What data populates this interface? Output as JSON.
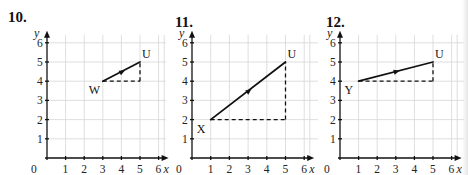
{
  "chart_data": [
    {
      "type": "line",
      "question": "10.",
      "xlabel": "x",
      "ylabel": "y",
      "xlim": [
        0,
        6
      ],
      "ylim": [
        0,
        6
      ],
      "x_ticks": [
        "0",
        "1",
        "2",
        "3",
        "4",
        "5",
        "6"
      ],
      "y_ticks": [
        "1",
        "2",
        "3",
        "4",
        "5",
        "6"
      ],
      "grid": true,
      "vector": {
        "from": {
          "label": "W",
          "x": 3,
          "y": 4
        },
        "to": {
          "label": "U",
          "x": 5,
          "y": 5
        }
      },
      "dashed_legs": [
        [
          [
            3,
            4
          ],
          [
            5,
            4
          ]
        ],
        [
          [
            5,
            4
          ],
          [
            5,
            5
          ]
        ]
      ]
    },
    {
      "type": "line",
      "question": "11.",
      "xlabel": "x",
      "ylabel": "y",
      "xlim": [
        0,
        6
      ],
      "ylim": [
        0,
        6
      ],
      "x_ticks": [
        "0",
        "1",
        "2",
        "3",
        "4",
        "5",
        "6"
      ],
      "y_ticks": [
        "1",
        "2",
        "3",
        "4",
        "5",
        "6"
      ],
      "grid": true,
      "vector": {
        "from": {
          "label": "X",
          "x": 1,
          "y": 2
        },
        "to": {
          "label": "U",
          "x": 5,
          "y": 5
        }
      },
      "dashed_legs": [
        [
          [
            1,
            2
          ],
          [
            5,
            2
          ]
        ],
        [
          [
            5,
            2
          ],
          [
            5,
            5
          ]
        ]
      ]
    },
    {
      "type": "line",
      "question": "12.",
      "xlabel": "x",
      "ylabel": "y",
      "xlim": [
        0,
        6
      ],
      "ylim": [
        0,
        6
      ],
      "x_ticks": [
        "0",
        "1",
        "2",
        "3",
        "4",
        "5",
        "6"
      ],
      "y_ticks": [
        "1",
        "2",
        "3",
        "4",
        "5",
        "6"
      ],
      "grid": true,
      "vector": {
        "from": {
          "label": "Y",
          "x": 1,
          "y": 4
        },
        "to": {
          "label": "U",
          "x": 5,
          "y": 5
        }
      },
      "dashed_legs": [
        [
          [
            1,
            4
          ],
          [
            5,
            4
          ]
        ],
        [
          [
            5,
            4
          ],
          [
            5,
            5
          ]
        ]
      ]
    }
  ],
  "layout": {
    "panels": [
      {
        "origin_x": 47,
        "origin_y": 158,
        "unit_x": 18.6,
        "unit_y": 19.2,
        "num_x": 8,
        "num_y": 22,
        "grid_right": 166
      },
      {
        "origin_x": 192,
        "origin_y": 158,
        "unit_x": 18.7,
        "unit_y": 19.2,
        "num_x": 175,
        "num_y": 27,
        "grid_right": 318
      },
      {
        "origin_x": 340,
        "origin_y": 158,
        "unit_x": 18.6,
        "unit_y": 19.2,
        "num_x": 326,
        "num_y": 27,
        "grid_right": 464
      }
    ]
  }
}
